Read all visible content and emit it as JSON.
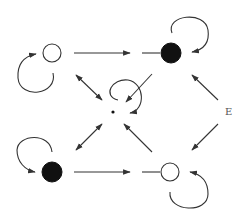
{
  "diagram": {
    "colors": {
      "stroke": "#333333",
      "filled": "#111111",
      "open": "#ffffff"
    },
    "nodes": [
      {
        "id": "top-left",
        "type": "open",
        "x": 52,
        "y": 53,
        "r": 9
      },
      {
        "id": "top-right",
        "type": "filled",
        "x": 171,
        "y": 53,
        "r": 10
      },
      {
        "id": "center",
        "type": "dot",
        "x": 113,
        "y": 112,
        "r": 1.5
      },
      {
        "id": "bottom-left",
        "type": "filled",
        "x": 52,
        "y": 172,
        "r": 10
      },
      {
        "id": "bottom-right",
        "type": "open",
        "x": 170,
        "y": 172,
        "r": 9
      }
    ],
    "label_E": "E",
    "edges": [
      {
        "from": "top-left",
        "to": "top-right",
        "kind": "one-way"
      },
      {
        "from": "bottom-left",
        "to": "bottom-right",
        "kind": "one-way"
      },
      {
        "from": "top-left",
        "to": "center",
        "kind": "two-way"
      },
      {
        "from": "center",
        "to": "bottom-left",
        "kind": "two-way"
      },
      {
        "from": "top-right",
        "to": "center",
        "kind": "one-way"
      },
      {
        "from": "bottom-right",
        "to": "center",
        "kind": "one-way"
      },
      {
        "from": "E",
        "to": "top-right",
        "kind": "one-way"
      },
      {
        "from": "E",
        "to": "bottom-right",
        "kind": "one-way"
      }
    ],
    "self_loops": [
      "top-left",
      "top-right",
      "center",
      "bottom-left",
      "bottom-right"
    ]
  }
}
